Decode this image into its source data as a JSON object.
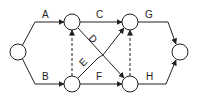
{
  "diagram": {
    "type": "activity-on-arrow network",
    "nodes": [
      {
        "id": "n1",
        "x": 18,
        "y": 52
      },
      {
        "id": "n2",
        "x": 72,
        "y": 22
      },
      {
        "id": "n3",
        "x": 72,
        "y": 84
      },
      {
        "id": "n4",
        "x": 130,
        "y": 22
      },
      {
        "id": "n5",
        "x": 130,
        "y": 84
      },
      {
        "id": "n6",
        "x": 180,
        "y": 52
      }
    ],
    "activities": [
      {
        "label": "A",
        "from": "n1",
        "to": "n2"
      },
      {
        "label": "B",
        "from": "n1",
        "to": "n3"
      },
      {
        "label": "C",
        "from": "n2",
        "to": "n4"
      },
      {
        "label": "D",
        "from": "n2",
        "to": "n5"
      },
      {
        "label": "E",
        "from": "n3",
        "to": "n4"
      },
      {
        "label": "F",
        "from": "n3",
        "to": "n5"
      },
      {
        "label": "G",
        "from": "n4",
        "to": "n6"
      },
      {
        "label": "H",
        "from": "n5",
        "to": "n6"
      }
    ],
    "dummies": [
      {
        "from": "n3",
        "to": "n2"
      },
      {
        "from": "n5",
        "to": "n4"
      }
    ],
    "labels": {
      "A": "A",
      "B": "B",
      "C": "C",
      "D": "D",
      "E": "E",
      "F": "F",
      "G": "G",
      "H": "H"
    }
  }
}
